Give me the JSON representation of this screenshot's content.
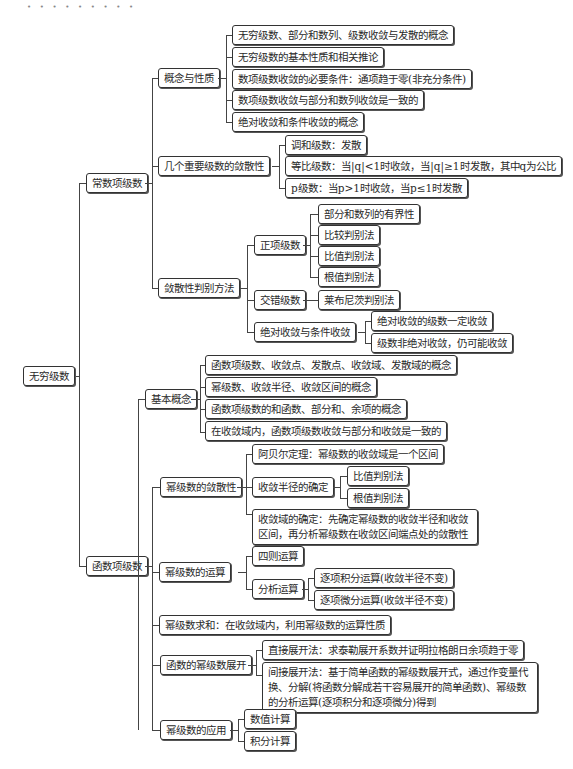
{
  "decoration": {
    "dots": "• • • • • • • • •"
  },
  "root": {
    "label": "无穷级数"
  },
  "constant_series": {
    "label": "常数项级数",
    "concept": {
      "label": "概念与性质",
      "items": [
        "无穷级数、部分和数列、级数收敛与发散的概念",
        "无穷级数的基本性质和相关推论",
        "数项级数收敛的必要条件：通项趋于零(非充分条件)",
        "数项级数收敛与部分和数列收敛是一致的",
        "绝对收敛和条件收敛的概念"
      ]
    },
    "important": {
      "label": "几个重要级数的敛散性",
      "items": [
        "调和级数：发散",
        "等比级数：当|q|<1时收敛，当|q|≥1时发散，其中q为公比",
        "p级数：当p>1时收敛，当p≤1时发散"
      ]
    },
    "tests": {
      "label": "敛散性判别方法",
      "positive": {
        "label": "正项级数",
        "items": [
          "部分和数列的有界性",
          "比较判别法",
          "比值判别法",
          "根值判别法"
        ]
      },
      "alternating": {
        "label": "交错级数",
        "items": [
          "莱布尼茨判别法"
        ]
      },
      "absolute": {
        "label": "绝对收敛与条件收敛",
        "items": [
          "绝对收敛的级数一定收敛",
          "级数非绝对收敛，仍可能收敛"
        ]
      }
    }
  },
  "function_series": {
    "label": "函数项级数",
    "basic": {
      "label": "基本概念",
      "items": [
        "函数项级数、收敛点、发散点、收敛域、发散域的概念",
        "幂级数、收敛半径、收敛区间的概念",
        "函数项级数的和函数、部分和、余项的概念",
        "在收敛域内，函数项级数收敛与部分和收敛是一致的"
      ]
    },
    "convergence": {
      "label": "幂级数的敛散性",
      "abel": "阿贝尔定理：幂级数的收敛域是一个区间",
      "radius": {
        "label": "收敛半径的确定",
        "items": [
          "比值判别法",
          "根值判别法"
        ]
      },
      "domain": "收敛域的确定：先确定幂级数的收敛半径和收敛区间，再分析幂级数在收敛区间端点处的敛散性"
    },
    "operations": {
      "label": "幂级数的运算",
      "arith": "四则运算",
      "analytic": {
        "label": "分析运算",
        "items": [
          "逐项积分运算(收敛半径不变)",
          "逐项微分运算(收敛半径不变)"
        ]
      }
    },
    "summation": "幂级数求和：在收敛域内，利用幂级数的运算性质",
    "expansion": {
      "label": "函数的幂级数展开",
      "items": [
        "直接展开法：求泰勒展开系数并证明拉格朗日余项趋于零",
        "间接展开法：基于简单函数的幂级数展开式，通过作变量代换、分解(将函数分解成若干容易展开的简单函数)、幂级数的分析运算(逐项积分和逐项微分)得到"
      ]
    },
    "applications": {
      "label": "幂级数的应用",
      "items": [
        "数值计算",
        "积分计算"
      ]
    }
  }
}
